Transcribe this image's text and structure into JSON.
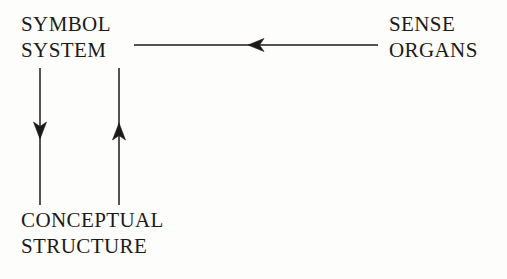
{
  "figure": {
    "title": "",
    "background_color": "#fdfdfc",
    "ink_color": "#1c1a18",
    "width": 507,
    "height": 279
  },
  "nodes": {
    "symbol_system": {
      "label": "SYMBOL SYSTEM",
      "line1": "SYMBOL",
      "line2": "SYSTEM"
    },
    "sense_organs": {
      "label": "SENSE ORGANS",
      "line1": "SENSE",
      "line2": "ORGANS"
    },
    "conceptual_structure": {
      "label": "CONCEPTUAL STRUCTURE",
      "line1": "CONCEPTUAL",
      "line2": "STRUCTURE"
    }
  },
  "arrows": [
    {
      "name": "sense-organs-to-symbol-system",
      "from": "sense_organs",
      "to": "symbol_system",
      "direction": "left",
      "orientation": "horizontal",
      "x_start": 378,
      "x_end": 134,
      "y": 45,
      "head_x": 248
    },
    {
      "name": "symbol-system-to-conceptual-structure",
      "from": "symbol_system",
      "to": "conceptual_structure",
      "direction": "down",
      "orientation": "vertical",
      "x": 40,
      "y_start": 68,
      "y_end": 205,
      "head_y": 133
    },
    {
      "name": "conceptual-structure-to-symbol-system",
      "from": "conceptual_structure",
      "to": "symbol_system",
      "direction": "up",
      "orientation": "vertical",
      "x": 119,
      "y_start": 205,
      "y_end": 68,
      "head_y": 130
    }
  ]
}
